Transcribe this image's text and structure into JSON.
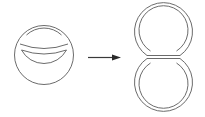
{
  "diagram": {
    "colors": {
      "background": "#ffffff",
      "stroke": "#5a5a5a",
      "arrow": "#2a2a2a"
    },
    "nodes": [
      {
        "id": "source-shape",
        "kind": "double-line circle with inner arc band",
        "label": ""
      },
      {
        "id": "target-shape",
        "kind": "double-line figure-eight (two stacked loops)",
        "label": ""
      }
    ],
    "edges": [
      {
        "from": "source-shape",
        "to": "target-shape",
        "kind": "right-arrow",
        "label": ""
      }
    ]
  }
}
